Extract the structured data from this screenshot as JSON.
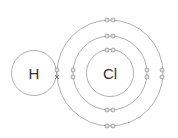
{
  "diagram": {
    "title": "",
    "type": "dot-and-cross diagram",
    "atoms": [
      {
        "symbol": "H",
        "label": "H",
        "center": [
          34,
          73
        ],
        "radius": 22.5
      },
      {
        "symbol": "Cl",
        "label": "Cl",
        "center": [
          110,
          73
        ],
        "shell_radii": [
          23.5,
          37,
          53
        ]
      }
    ],
    "electrons": {
      "hydrogen_shared": "cross",
      "chlorine_shell_1": 2,
      "chlorine_shell_2": 8,
      "chlorine_shell_3": 7
    },
    "colors": {
      "line": "#9a9a9a",
      "electron_fill": "#e6e6e6",
      "text": "#333333"
    }
  }
}
